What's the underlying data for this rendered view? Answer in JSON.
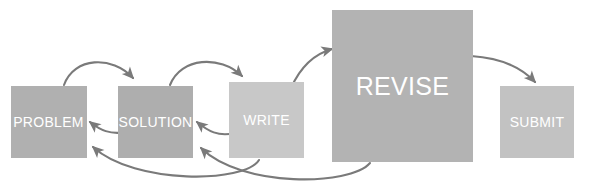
{
  "diagram": {
    "canvas": {
      "width": 590,
      "height": 190,
      "background": "#ffffff"
    },
    "arrow_color": "#7a7a7a",
    "label_color": "#ffffff",
    "nodes": [
      {
        "id": "problem",
        "label": "PROBLEM",
        "color": "#b0b0b0",
        "x": 11,
        "y": 86,
        "width": 76,
        "height": 72,
        "size": "small"
      },
      {
        "id": "solution",
        "label": "SOLUTION",
        "color": "#aeaeae",
        "x": 118,
        "y": 86,
        "width": 75,
        "height": 72,
        "size": "small"
      },
      {
        "id": "write",
        "label": "WRITE",
        "color": "#c8c8c8",
        "x": 229,
        "y": 82,
        "width": 75,
        "height": 76,
        "size": "small"
      },
      {
        "id": "revise",
        "label": "REVISE",
        "color": "#b3b3b3",
        "x": 332,
        "y": 10,
        "width": 141,
        "height": 152,
        "size": "large"
      },
      {
        "id": "submit",
        "label": "SUBMIT",
        "color": "#c2c2c2",
        "x": 500,
        "y": 86,
        "width": 74,
        "height": 72,
        "size": "small"
      }
    ],
    "arrows": [
      {
        "id": "problem-to-solution",
        "from": "problem",
        "to": "solution",
        "kind": "arc-over",
        "description": "PROBLEM top arcs over to SOLUTION top"
      },
      {
        "id": "solution-to-write",
        "from": "solution",
        "to": "write",
        "kind": "arc-over",
        "description": "SOLUTION top arcs over to WRITE top"
      },
      {
        "id": "write-to-revise",
        "from": "write",
        "to": "revise",
        "kind": "arc-up",
        "description": "WRITE top-right arcs up to REVISE left edge"
      },
      {
        "id": "revise-to-submit",
        "from": "revise",
        "to": "submit",
        "kind": "arc-down",
        "description": "REVISE right edge arcs down to SUBMIT top"
      },
      {
        "id": "solution-to-problem",
        "from": "solution",
        "to": "problem",
        "kind": "back-short",
        "description": "SOLUTION left arcs back to PROBLEM right edge"
      },
      {
        "id": "write-to-solution",
        "from": "write",
        "to": "solution",
        "kind": "back-short",
        "description": "WRITE left arcs back to SOLUTION right edge"
      },
      {
        "id": "write-to-problem",
        "from": "write",
        "to": "problem",
        "kind": "back-long",
        "description": "WRITE bottom sweeps low back to PROBLEM lower-right"
      },
      {
        "id": "revise-to-solution",
        "from": "revise",
        "to": "solution",
        "kind": "back-long",
        "description": "REVISE bottom-left sweeps low back to SOLUTION lower-right"
      }
    ]
  }
}
